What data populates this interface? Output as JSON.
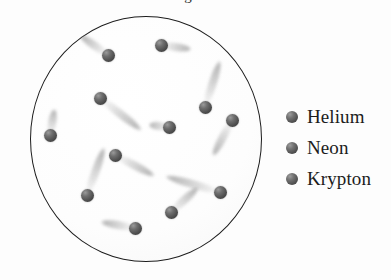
{
  "diagram": {
    "type": "particle-container-illustration",
    "caption_fragment": "g",
    "container": {
      "shape": "circle",
      "center_x": 146,
      "center_y": 139,
      "width": 232,
      "height": 246,
      "border_color": "#1d1d1d",
      "fill_color": "#fdfdfd"
    },
    "particle_style": {
      "diameter": 13,
      "color": "#4a4a4a",
      "highlight_color": "#9a9a9a",
      "trail_color": "#8c8c8c",
      "trail_description": "motion blur streak"
    },
    "particles": [
      {
        "id": "p1",
        "x": 161,
        "y": 45,
        "size": 13,
        "trail_angle": 8,
        "trail_length": 30
      },
      {
        "id": "p2",
        "x": 108,
        "y": 55,
        "size": 13,
        "trail_angle": 215,
        "trail_length": 34
      },
      {
        "id": "p3",
        "x": 100,
        "y": 98,
        "size": 13,
        "trail_angle": 38,
        "trail_length": 52
      },
      {
        "id": "p4",
        "x": 205,
        "y": 107,
        "size": 13,
        "trail_angle": 288,
        "trail_length": 48
      },
      {
        "id": "p5",
        "x": 232,
        "y": 120,
        "size": 13,
        "trail_angle": 118,
        "trail_length": 40
      },
      {
        "id": "p6",
        "x": 50,
        "y": 135,
        "size": 13,
        "trail_angle": 280,
        "trail_length": 26
      },
      {
        "id": "p7",
        "x": 169,
        "y": 127,
        "size": 13,
        "trail_angle": 186,
        "trail_length": 20
      },
      {
        "id": "p8",
        "x": 115,
        "y": 155,
        "size": 13,
        "trail_angle": 28,
        "trail_length": 44
      },
      {
        "id": "p9",
        "x": 87,
        "y": 195,
        "size": 13,
        "trail_angle": 290,
        "trail_length": 50
      },
      {
        "id": "p10",
        "x": 220,
        "y": 192,
        "size": 13,
        "trail_angle": 196,
        "trail_length": 56
      },
      {
        "id": "p11",
        "x": 171,
        "y": 212,
        "size": 13,
        "trail_angle": 318,
        "trail_length": 36
      },
      {
        "id": "p12",
        "x": 135,
        "y": 228,
        "size": 13,
        "trail_angle": 190,
        "trail_length": 34
      }
    ]
  },
  "legend": {
    "items": [
      {
        "label": "Helium",
        "marker_color": "#4a4a4a"
      },
      {
        "label": "Neon",
        "marker_color": "#4a4a4a"
      },
      {
        "label": "Krypton",
        "marker_color": "#4a4a4a"
      }
    ]
  }
}
